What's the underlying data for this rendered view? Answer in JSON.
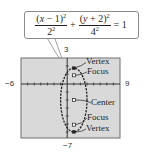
{
  "equation": {
    "term1_numerator_var": "x",
    "term1_numerator_shift": " − 1)",
    "term1_numerator_open": "(",
    "term1_numerator_exp": "2",
    "term1_denominator_base": "2",
    "term1_denominator_exp": "2",
    "plus": "+",
    "term2_numerator_open": "(",
    "term2_numerator_var": "y",
    "term2_numerator_shift": " + 2)",
    "term2_numerator_exp": "2",
    "term2_denominator_base": "4",
    "term2_denominator_exp": "2",
    "equals": "= 1"
  },
  "window": {
    "xmin": "−6",
    "xmax": "9",
    "ymax": "3",
    "ymin": "−7"
  },
  "annotations": {
    "top_vertex": "Vertex",
    "top_focus": "Focus",
    "center": "Center",
    "bottom_focus": "Focus",
    "bottom_vertex": "Vertex"
  },
  "colors": {
    "screen_background": "#d9d9d9",
    "screen_border": "#6e6e6e",
    "curve": "#231f20",
    "callout_border": "#8a8a8a"
  }
}
